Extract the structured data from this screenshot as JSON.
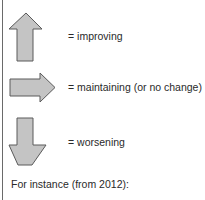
{
  "legend": {
    "items": [
      {
        "icon": "up-arrow-icon",
        "label": "= improving"
      },
      {
        "icon": "right-arrow-icon",
        "label": "= maintaining (or no change)"
      },
      {
        "icon": "down-arrow-icon",
        "label": "= worsening"
      }
    ],
    "footer": "For instance (from 2012):"
  },
  "colors": {
    "arrow_fill": "#c4c4c4",
    "arrow_stroke": "#5a5a5a",
    "text": "#2a2a2a"
  }
}
